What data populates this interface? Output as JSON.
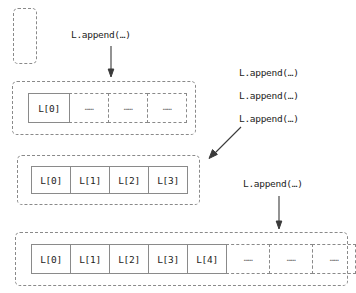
{
  "diagram": {
    "colors": {
      "border": "#8a8a8a",
      "text": "#1c1c1c",
      "arrow": "#3a3a3a",
      "background": "#ffffff"
    },
    "ellipsis_glyph": "……"
  },
  "stages": [
    {
      "id": "stage-0",
      "name": "empty-list-container",
      "cells": []
    },
    {
      "id": "stage-1",
      "name": "one-element-container",
      "cells": [
        {
          "label": "L[0]",
          "state": "filled"
        },
        {
          "label": "……",
          "state": "empty"
        },
        {
          "label": "……",
          "state": "empty"
        },
        {
          "label": "……",
          "state": "empty"
        }
      ]
    },
    {
      "id": "stage-2",
      "name": "four-element-container",
      "cells": [
        {
          "label": "L[0]",
          "state": "filled"
        },
        {
          "label": "L[1]",
          "state": "filled"
        },
        {
          "label": "L[2]",
          "state": "filled"
        },
        {
          "label": "L[3]",
          "state": "filled"
        }
      ]
    },
    {
      "id": "stage-3",
      "name": "five-element-container",
      "cells": [
        {
          "label": "L[0]",
          "state": "filled"
        },
        {
          "label": "L[1]",
          "state": "filled"
        },
        {
          "label": "L[2]",
          "state": "filled"
        },
        {
          "label": "L[3]",
          "state": "filled"
        },
        {
          "label": "L[4]",
          "state": "filled"
        },
        {
          "label": "……",
          "state": "empty"
        },
        {
          "label": "……",
          "state": "empty"
        },
        {
          "label": "……",
          "state": "empty"
        }
      ]
    }
  ],
  "captions": {
    "append_1": "L.append(…)",
    "append_2": "L.append(…)",
    "append_3": "L.append(…)",
    "append_4": "L.append(…)",
    "append_5": "L.append(…)"
  }
}
